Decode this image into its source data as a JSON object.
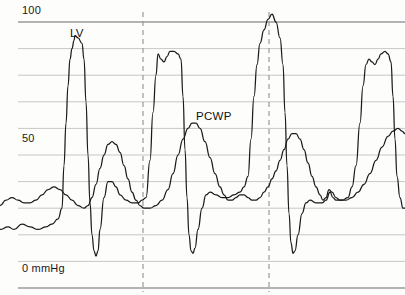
{
  "chart_data": {
    "type": "line",
    "title": "",
    "xlabel": "",
    "ylabel": "mmHg",
    "ylim": [
      0,
      100
    ],
    "yticks": [
      0,
      10,
      20,
      30,
      40,
      50,
      60,
      70,
      80,
      90,
      100
    ],
    "ytick_labels_shown": [
      "0 mmHg",
      "50",
      "100"
    ],
    "grid": true,
    "grid_orientation": "horizontal",
    "legend_position": "inline-annotation",
    "annotations": [
      {
        "text": "LV",
        "x_px": 70,
        "y_mmHg": 90
      },
      {
        "text": "PCWP",
        "x_px": 196,
        "y_mmHg": 66
      }
    ],
    "vertical_markers": {
      "style": "dashed",
      "color": "#9a9a9a",
      "x_px": [
        143,
        269
      ]
    },
    "series": [
      {
        "name": "LV",
        "label": "LV",
        "color": "#1a1a1a",
        "description": "Left ventricular pressure tracing, four cardiac cycles",
        "peaks_mmHg": [
          95,
          88,
          103,
          89
        ],
        "nadirs_mmHg": [
          12,
          13,
          13
        ],
        "points": [
          [
            0,
            22
          ],
          [
            8,
            23
          ],
          [
            14,
            22
          ],
          [
            22,
            24
          ],
          [
            30,
            23
          ],
          [
            38,
            22
          ],
          [
            46,
            23
          ],
          [
            52,
            24
          ],
          [
            58,
            26
          ],
          [
            62,
            30
          ],
          [
            64,
            46
          ],
          [
            66,
            62
          ],
          [
            68,
            76
          ],
          [
            70,
            86
          ],
          [
            72,
            90
          ],
          [
            74,
            93
          ],
          [
            75,
            95
          ],
          [
            78,
            94
          ],
          [
            82,
            92
          ],
          [
            84,
            86
          ],
          [
            86,
            70
          ],
          [
            88,
            50
          ],
          [
            90,
            32
          ],
          [
            92,
            20
          ],
          [
            94,
            14
          ],
          [
            96,
            12
          ],
          [
            98,
            14
          ],
          [
            100,
            22
          ],
          [
            104,
            34
          ],
          [
            108,
            40
          ],
          [
            112,
            40
          ],
          [
            116,
            38
          ],
          [
            120,
            35
          ],
          [
            126,
            33
          ],
          [
            132,
            32
          ],
          [
            138,
            32
          ],
          [
            142,
            33
          ],
          [
            146,
            34
          ],
          [
            150,
            48
          ],
          [
            153,
            66
          ],
          [
            156,
            80
          ],
          [
            158,
            88
          ],
          [
            161,
            86
          ],
          [
            164,
            85
          ],
          [
            167,
            87
          ],
          [
            170,
            89
          ],
          [
            174,
            89
          ],
          [
            178,
            88
          ],
          [
            181,
            86
          ],
          [
            183,
            72
          ],
          [
            185,
            52
          ],
          [
            187,
            34
          ],
          [
            189,
            20
          ],
          [
            191,
            14
          ],
          [
            193,
            13
          ],
          [
            195,
            15
          ],
          [
            198,
            22
          ],
          [
            202,
            30
          ],
          [
            206,
            35
          ],
          [
            210,
            36
          ],
          [
            216,
            35
          ],
          [
            222,
            34
          ],
          [
            228,
            34
          ],
          [
            234,
            35
          ],
          [
            240,
            36
          ],
          [
            244,
            38
          ],
          [
            248,
            42
          ],
          [
            251,
            56
          ],
          [
            254,
            72
          ],
          [
            257,
            84
          ],
          [
            260,
            92
          ],
          [
            264,
            97
          ],
          [
            268,
            101
          ],
          [
            272,
            103
          ],
          [
            276,
            100
          ],
          [
            280,
            94
          ],
          [
            283,
            84
          ],
          [
            285,
            66
          ],
          [
            287,
            46
          ],
          [
            289,
            28
          ],
          [
            291,
            17
          ],
          [
            293,
            13
          ],
          [
            295,
            14
          ],
          [
            298,
            20
          ],
          [
            302,
            28
          ],
          [
            306,
            32
          ],
          [
            310,
            33
          ],
          [
            316,
            32
          ],
          [
            322,
            32
          ],
          [
            326,
            33
          ],
          [
            330,
            36
          ],
          [
            333,
            34
          ],
          [
            336,
            33
          ],
          [
            342,
            33
          ],
          [
            348,
            34
          ],
          [
            352,
            38
          ],
          [
            356,
            46
          ],
          [
            360,
            62
          ],
          [
            363,
            76
          ],
          [
            366,
            84
          ],
          [
            369,
            86
          ],
          [
            372,
            85
          ],
          [
            375,
            84
          ],
          [
            378,
            86
          ],
          [
            381,
            88
          ],
          [
            385,
            89
          ],
          [
            388,
            88
          ],
          [
            391,
            85
          ],
          [
            393,
            72
          ],
          [
            395,
            56
          ],
          [
            397,
            42
          ],
          [
            400,
            34
          ],
          [
            403,
            30
          ],
          [
            405,
            30
          ]
        ]
      },
      {
        "name": "PCWP",
        "label": "PCWP",
        "color": "#1a1a1a",
        "description": "Pulmonary capillary wedge pressure tracing, damped low-amplitude waveform",
        "peaks_mmHg": [
          55,
          62,
          58
        ],
        "troughs_mmHg": [
          28,
          30,
          31
        ],
        "points": [
          [
            0,
            31
          ],
          [
            6,
            33
          ],
          [
            12,
            34
          ],
          [
            18,
            33
          ],
          [
            24,
            32
          ],
          [
            30,
            32
          ],
          [
            36,
            33
          ],
          [
            42,
            35
          ],
          [
            48,
            37
          ],
          [
            54,
            38
          ],
          [
            60,
            37
          ],
          [
            66,
            35
          ],
          [
            72,
            33
          ],
          [
            78,
            31
          ],
          [
            84,
            30
          ],
          [
            88,
            31
          ],
          [
            92,
            34
          ],
          [
            96,
            39
          ],
          [
            100,
            45
          ],
          [
            104,
            50
          ],
          [
            108,
            54
          ],
          [
            112,
            55
          ],
          [
            116,
            54
          ],
          [
            120,
            51
          ],
          [
            124,
            46
          ],
          [
            128,
            41
          ],
          [
            132,
            36
          ],
          [
            136,
            33
          ],
          [
            140,
            31
          ],
          [
            144,
            30
          ],
          [
            150,
            30
          ],
          [
            156,
            31
          ],
          [
            162,
            33
          ],
          [
            168,
            37
          ],
          [
            173,
            43
          ],
          [
            178,
            50
          ],
          [
            183,
            56
          ],
          [
            188,
            60
          ],
          [
            192,
            62
          ],
          [
            196,
            62
          ],
          [
            200,
            60
          ],
          [
            205,
            55
          ],
          [
            210,
            49
          ],
          [
            215,
            43
          ],
          [
            220,
            38
          ],
          [
            224,
            35
          ],
          [
            228,
            33
          ],
          [
            232,
            33
          ],
          [
            236,
            34
          ],
          [
            240,
            35
          ],
          [
            244,
            35
          ],
          [
            248,
            34
          ],
          [
            252,
            33
          ],
          [
            256,
            33
          ],
          [
            260,
            34
          ],
          [
            264,
            36
          ],
          [
            268,
            38
          ],
          [
            272,
            41
          ],
          [
            276,
            44
          ],
          [
            280,
            48
          ],
          [
            284,
            52
          ],
          [
            288,
            56
          ],
          [
            292,
            58
          ],
          [
            296,
            58
          ],
          [
            300,
            56
          ],
          [
            304,
            52
          ],
          [
            308,
            47
          ],
          [
            312,
            42
          ],
          [
            316,
            38
          ],
          [
            320,
            35
          ],
          [
            323,
            33
          ],
          [
            326,
            34
          ],
          [
            329,
            37
          ],
          [
            332,
            36
          ],
          [
            336,
            34
          ],
          [
            340,
            33
          ],
          [
            346,
            33
          ],
          [
            352,
            34
          ],
          [
            358,
            36
          ],
          [
            364,
            39
          ],
          [
            370,
            43
          ],
          [
            376,
            48
          ],
          [
            382,
            53
          ],
          [
            388,
            57
          ],
          [
            393,
            59
          ],
          [
            398,
            60
          ],
          [
            402,
            59
          ],
          [
            405,
            58
          ]
        ]
      }
    ]
  },
  "axis": {
    "top_label": "100",
    "mid_label": "50",
    "bottom_label": "0 mmHg"
  },
  "labels": {
    "lv": "LV",
    "pcwp": "PCWP"
  },
  "colors": {
    "trace": "#1a1a1a",
    "grid": "#b9b9b9",
    "grid_strong": "#6a6a6a",
    "dashed_marker": "#9a9a9a",
    "background": "#fdfdfc",
    "text": "#111111"
  }
}
